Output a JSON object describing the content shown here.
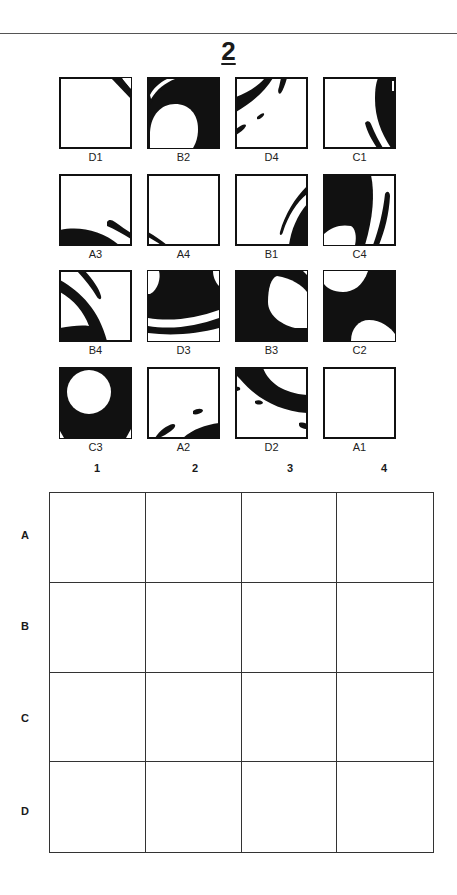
{
  "page": {
    "number": "2"
  },
  "tiles": [
    {
      "label": "D1"
    },
    {
      "label": "B2"
    },
    {
      "label": "D4"
    },
    {
      "label": "C1"
    },
    {
      "label": "A3"
    },
    {
      "label": "A4"
    },
    {
      "label": "B1"
    },
    {
      "label": "C4"
    },
    {
      "label": "B4"
    },
    {
      "label": "D3"
    },
    {
      "label": "B3"
    },
    {
      "label": "C2"
    },
    {
      "label": "C3"
    },
    {
      "label": "A2"
    },
    {
      "label": "D2"
    },
    {
      "label": "A1"
    }
  ],
  "answer_grid": {
    "columns": [
      "1",
      "2",
      "3",
      "4"
    ],
    "rows": [
      "A",
      "B",
      "C",
      "D"
    ]
  },
  "colors": {
    "ink": "#111111",
    "paper": "#ffffff",
    "line": "#333333"
  }
}
